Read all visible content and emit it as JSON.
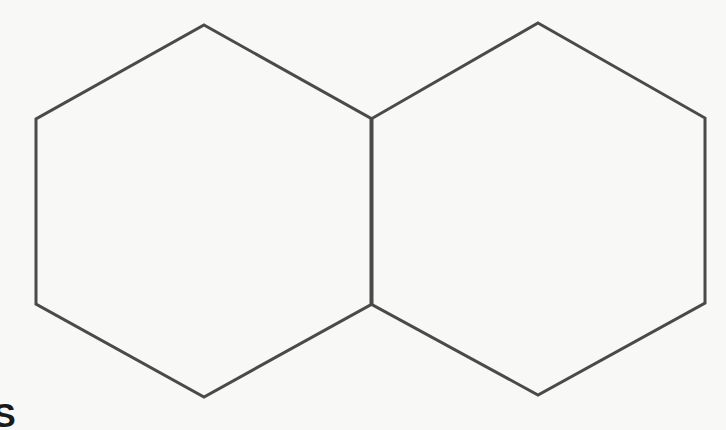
{
  "diagram": {
    "type": "fused-hexagons",
    "stroke_color": "#4a4a4a",
    "stroke_width": 3,
    "background_color": "#f8f8f7",
    "shapes": [
      {
        "name": "left-hexagon",
        "points": "204,25 372,119 372,304 204,397 36,304 36,119"
      },
      {
        "name": "right-hexagon",
        "points": "538,23 705,118 705,303 538,395 371,304 371,119"
      }
    ],
    "corner_label": "S"
  }
}
